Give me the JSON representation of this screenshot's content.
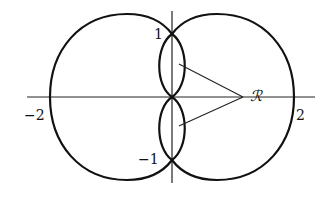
{
  "diagram": {
    "axes": {
      "horizontal": {
        "from": -2.4,
        "to": 2.3
      },
      "vertical": {
        "from": -1.4,
        "to": 1.4
      }
    },
    "labels": {
      "y_pos_one": "1",
      "y_neg_one": "−1",
      "x_neg_two": "−2",
      "x_pos_two": "2",
      "region": "ℛ"
    },
    "colors": {
      "stroke": "#111111",
      "background": "#ffffff"
    }
  }
}
